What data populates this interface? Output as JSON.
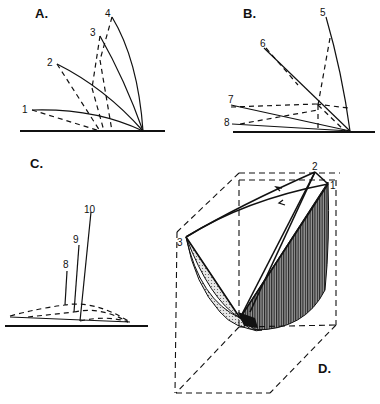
{
  "figure": {
    "panels": [
      {
        "id": "A",
        "label": "A.",
        "numbers": [
          "1",
          "2",
          "3",
          "4"
        ]
      },
      {
        "id": "B",
        "label": "B.",
        "numbers": [
          "5",
          "6",
          "7",
          "8"
        ]
      },
      {
        "id": "C",
        "label": "C.",
        "numbers": [
          "8",
          "9",
          "10"
        ]
      },
      {
        "id": "D",
        "label": "D.",
        "numbers": [
          "1",
          "2",
          "3"
        ]
      }
    ]
  },
  "colors": {
    "ink": "#111111",
    "background": "#ffffff",
    "shade_light": "#d8d8d8",
    "shade_dark": "#7a7a7a"
  }
}
